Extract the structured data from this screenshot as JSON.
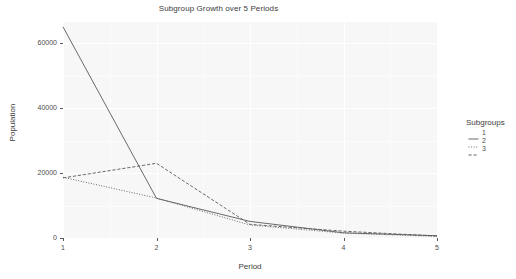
{
  "chart_data": {
    "type": "line",
    "title": "Subgroup Growth over 5 Periods",
    "xlabel": "Period",
    "ylabel": "Population",
    "x": [
      1,
      2,
      3,
      4,
      5
    ],
    "xticklabels": [
      "1",
      "2",
      "3",
      "4",
      "5"
    ],
    "yticklabels": [
      "0",
      "20000",
      "40000",
      "60000"
    ],
    "ytickvalues": [
      0,
      20000,
      40000,
      60000
    ],
    "xlim": [
      1,
      5
    ],
    "ylim": [
      0,
      66500
    ],
    "grid": true,
    "legend_position": "right",
    "legend_title": "Subgroups",
    "series": [
      {
        "name": "1",
        "linestyle": "solid",
        "color": "#595959",
        "values": [
          65000,
          12200,
          5100,
          1600,
          700
        ]
      },
      {
        "name": "2",
        "linestyle": "dotted",
        "color": "#595959",
        "values": [
          18700,
          12300,
          4000,
          1500,
          500
        ]
      },
      {
        "name": "3",
        "linestyle": "dashed",
        "color": "#595959",
        "values": [
          18500,
          23000,
          4200,
          2100,
          600
        ]
      }
    ]
  },
  "figure": {
    "background": "#ffffff",
    "panel_background": "#f7f7f7",
    "grid_color": "#ffffff",
    "text_color": "#4d4d4d"
  }
}
